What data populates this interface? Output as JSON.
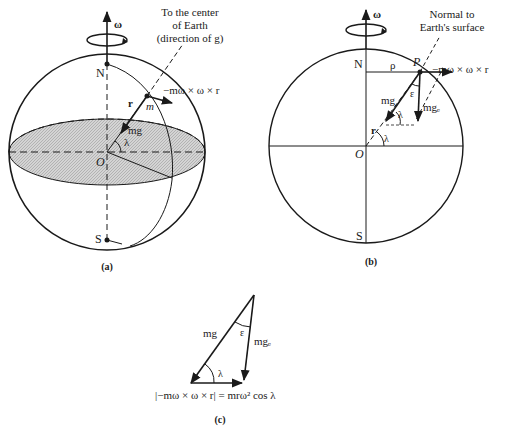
{
  "figure": {
    "panel_a": {
      "caption": "(a)",
      "omega": "ω",
      "north": "N",
      "south": "S",
      "origin": "O",
      "lambda": "λ",
      "r": "r",
      "m": "m",
      "mg": "mg",
      "centrifugal": "−mω × ω × r",
      "note_line1": "To the center",
      "note_line2": "of Earth",
      "note_line3": "(direction of g)"
    },
    "panel_b": {
      "caption": "(b)",
      "omega": "ω",
      "north": "N",
      "south": "S",
      "origin": "O",
      "rho": "ρ",
      "point": "P",
      "lambda_inner": "λ",
      "lambda_center": "λ",
      "epsilon": "ε",
      "r": "r",
      "mg": "mg",
      "mge": "mgₑ",
      "centrifugal": "−mω × ω × r",
      "note_line1": "Normal to",
      "note_line2": "Earth's surface"
    },
    "panel_c": {
      "caption": "(c)",
      "mg": "mg",
      "mge": "mgₑ",
      "epsilon": "ε",
      "lambda": "λ",
      "equation": "|−mω × ω × r| = mrω² cos λ"
    },
    "colors": {
      "ink": "#1a1a1a",
      "equator_fill": "#c8c8c8",
      "background": "#ffffff"
    }
  }
}
